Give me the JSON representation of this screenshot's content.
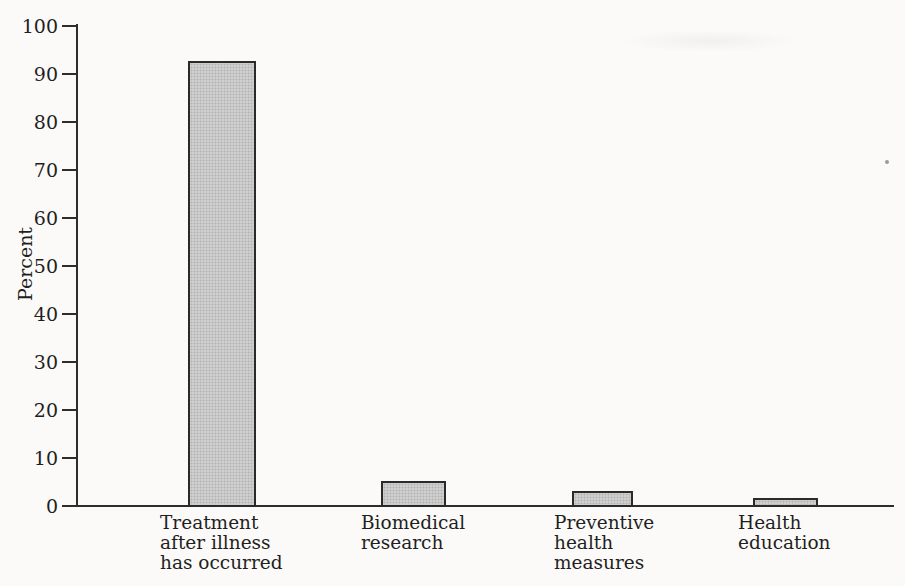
{
  "chart_data": {
    "type": "bar",
    "title": "",
    "xlabel": "",
    "ylabel": "Percent",
    "ylim": [
      0,
      100
    ],
    "ytick_interval": 10,
    "yticks": [
      0,
      10,
      20,
      30,
      40,
      50,
      60,
      70,
      80,
      90,
      100
    ],
    "categories": [
      "Treatment after illness has occurred",
      "Biomedical research",
      "Preventive health measures",
      "Health education"
    ],
    "category_label_lines": [
      [
        "Treatment",
        "after illness",
        "has occurred"
      ],
      [
        "Biomedical",
        "research"
      ],
      [
        "Preventive",
        "health",
        "measures"
      ],
      [
        "Health",
        "education"
      ]
    ],
    "values": [
      92.5,
      5,
      3,
      1.5
    ],
    "grid": false,
    "legend": false,
    "colors": {
      "bar_fill": "#cfcfcf",
      "bar_border": "#2a2a2a",
      "axis": "#2d2d2d",
      "text": "#1f1f1f",
      "background": "#fbfaf8"
    }
  }
}
